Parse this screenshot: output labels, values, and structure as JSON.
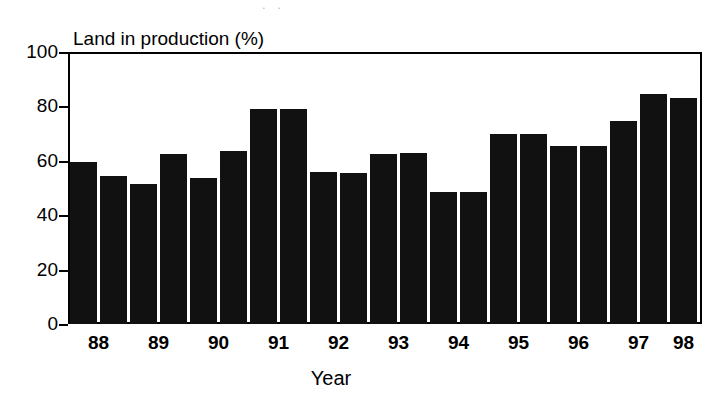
{
  "chart_data": {
    "type": "bar",
    "title": "",
    "ylabel": "Land in production (%)",
    "xlabel": "Year",
    "ylim": [
      0,
      100
    ],
    "yticks": [
      0,
      20,
      40,
      60,
      80,
      100
    ],
    "ytick_labels": [
      "0",
      "20",
      "40",
      "60",
      "80",
      "100"
    ],
    "grid": false,
    "legend": "none",
    "categories": [
      "88",
      "89",
      "90",
      "91",
      "92",
      "93",
      "94",
      "95",
      "96",
      "97",
      "98"
    ],
    "xtick_labels": [
      "88",
      "89",
      "90",
      "91",
      "92",
      "93",
      "94",
      "95",
      "96",
      "97",
      "98"
    ],
    "bar_color": "#111111",
    "note": "Two bars per year (semi-annual) for 88 through 97, single bar for 98; 21 bars total.",
    "bars": [
      {
        "label": "88",
        "period": "88-1",
        "value": 59.5
      },
      {
        "label": "88",
        "period": "88-2",
        "value": 54.5
      },
      {
        "label": "89",
        "period": "89-1",
        "value": 51.5
      },
      {
        "label": "89",
        "period": "89-2",
        "value": 62.5
      },
      {
        "label": "90",
        "period": "90-1",
        "value": 53.5
      },
      {
        "label": "90",
        "period": "90-2",
        "value": 63.5
      },
      {
        "label": "91",
        "period": "91-1",
        "value": 79.0
      },
      {
        "label": "91",
        "period": "91-2",
        "value": 79.0
      },
      {
        "label": "92",
        "period": "92-1",
        "value": 56.0
      },
      {
        "label": "92",
        "period": "92-2",
        "value": 55.5
      },
      {
        "label": "93",
        "period": "93-1",
        "value": 62.5
      },
      {
        "label": "93",
        "period": "93-2",
        "value": 63.0
      },
      {
        "label": "94",
        "period": "94-1",
        "value": 48.5
      },
      {
        "label": "94",
        "period": "94-2",
        "value": 48.5
      },
      {
        "label": "95",
        "period": "95-1",
        "value": 70.0
      },
      {
        "label": "95",
        "period": "95-2",
        "value": 70.0
      },
      {
        "label": "96",
        "period": "96-1",
        "value": 65.5
      },
      {
        "label": "96",
        "period": "96-2",
        "value": 65.5
      },
      {
        "label": "97",
        "period": "97-1",
        "value": 74.5
      },
      {
        "label": "97",
        "period": "97-2",
        "value": 84.5
      },
      {
        "label": "98",
        "period": "98-1",
        "value": 83.0
      }
    ]
  },
  "artifact": {
    "top_edge_fragment": ". ."
  }
}
